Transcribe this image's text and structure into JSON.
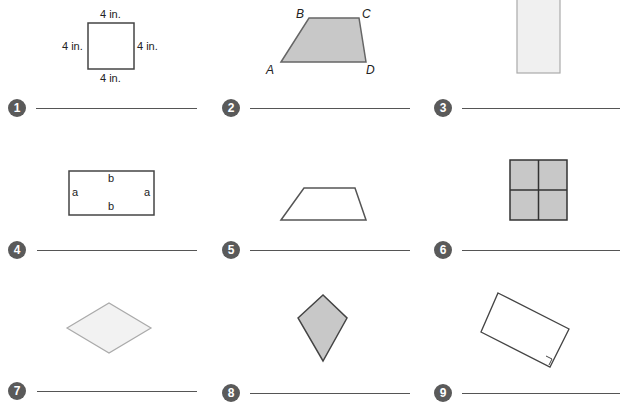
{
  "problems": [
    {
      "number": "1",
      "labels": {
        "top": "4 in.",
        "left": "4 in.",
        "right": "4 in.",
        "bottom": "4 in."
      },
      "shape": "square-icon"
    },
    {
      "number": "2",
      "labels": {
        "a": "A",
        "b": "B",
        "c": "C",
        "d": "D"
      },
      "shape": "trapezoid-icon"
    },
    {
      "number": "3",
      "shape": "tall-rectangle-icon"
    },
    {
      "number": "4",
      "labels": {
        "top": "b",
        "bottom": "b",
        "left": "a",
        "right": "a"
      },
      "shape": "rectangle-icon"
    },
    {
      "number": "5",
      "shape": "trapezoid-outline-icon"
    },
    {
      "number": "6",
      "shape": "grid-square-icon"
    },
    {
      "number": "7",
      "shape": "rhombus-icon"
    },
    {
      "number": "8",
      "shape": "kite-icon"
    },
    {
      "number": "9",
      "shape": "rotated-rectangle-icon"
    }
  ],
  "colors": {
    "badge": "#5a5a5a",
    "stroke": "#444444",
    "fill_gray": "#c8c8c8",
    "fill_light": "#f0f0f0",
    "line": "#555555"
  }
}
